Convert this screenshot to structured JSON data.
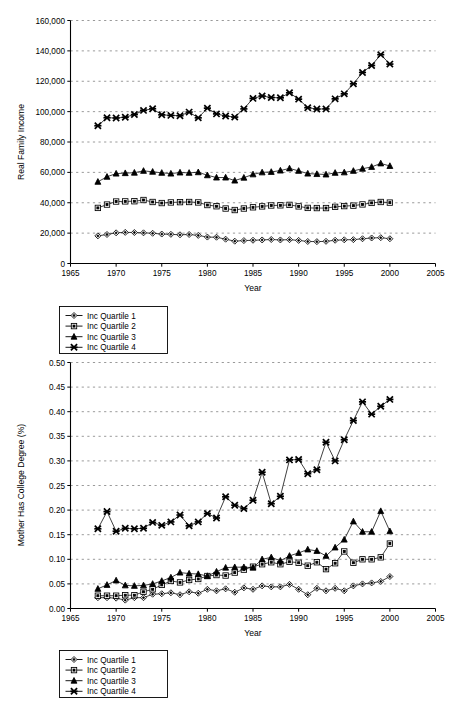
{
  "chart_data": [
    {
      "type": "line",
      "title": "",
      "xlabel": "Year",
      "ylabel": "Real Family Income",
      "xlim": [
        1965,
        2005
      ],
      "ylim": [
        0,
        160000
      ],
      "xticks": [
        1965,
        1970,
        1975,
        1980,
        1985,
        1990,
        1995,
        2000,
        2005
      ],
      "yticks": [
        0,
        20000,
        40000,
        60000,
        80000,
        100000,
        120000,
        140000,
        160000
      ],
      "ytick_labels": [
        "0",
        "20,000",
        "40,000",
        "60,000",
        "80,000",
        "100,000",
        "120,000",
        "140,000",
        "160,000"
      ],
      "grid": true,
      "legend_position": "below",
      "x": [
        1968,
        1969,
        1970,
        1971,
        1972,
        1973,
        1974,
        1975,
        1976,
        1977,
        1978,
        1979,
        1980,
        1981,
        1982,
        1983,
        1984,
        1985,
        1986,
        1987,
        1988,
        1989,
        1990,
        1991,
        1992,
        1993,
        1994,
        1995,
        1996,
        1997,
        1998,
        1999,
        2000
      ],
      "series": [
        {
          "name": "Inc Quartile 1",
          "marker": "diamond",
          "values": [
            18200,
            19100,
            20200,
            20500,
            20400,
            20200,
            19900,
            19400,
            19200,
            18900,
            19100,
            18500,
            17400,
            17300,
            16000,
            14700,
            15100,
            15300,
            15500,
            15800,
            15500,
            15700,
            15200,
            14500,
            14400,
            14600,
            15300,
            15600,
            15700,
            16300,
            16800,
            17000,
            16300
          ]
        },
        {
          "name": "Inc Quartile 2",
          "marker": "square",
          "values": [
            36600,
            38800,
            40800,
            40900,
            41000,
            41800,
            40500,
            39800,
            40200,
            40400,
            40500,
            40200,
            38500,
            37700,
            36200,
            35200,
            36200,
            37000,
            37600,
            38200,
            38300,
            38600,
            37600,
            36600,
            36500,
            36500,
            37300,
            37800,
            38100,
            38900,
            39900,
            40500,
            40100
          ]
        },
        {
          "name": "Inc Quartile 3",
          "marker": "triangle",
          "values": [
            53800,
            57100,
            59200,
            59500,
            59800,
            61000,
            60400,
            59700,
            59200,
            59900,
            59700,
            60100,
            58100,
            56600,
            56600,
            54600,
            56500,
            58700,
            60000,
            60300,
            61200,
            62600,
            61000,
            59200,
            58900,
            58600,
            59700,
            60000,
            61000,
            62400,
            63600,
            65900,
            64200
          ]
        },
        {
          "name": "Inc Quartile 4",
          "marker": "x",
          "values": [
            90700,
            96000,
            95800,
            96300,
            98100,
            100800,
            101900,
            97900,
            97500,
            97300,
            99700,
            95900,
            102300,
            98500,
            97100,
            96400,
            101800,
            108700,
            110300,
            109300,
            109100,
            112400,
            108200,
            102600,
            101700,
            101800,
            108400,
            111700,
            118300,
            125800,
            130400,
            137500,
            131300
          ]
        }
      ]
    },
    {
      "type": "line",
      "title": "",
      "xlabel": "Year",
      "ylabel": "Mother Has College Degree (%)",
      "xlim": [
        1965,
        2005
      ],
      "ylim": [
        0.0,
        0.5
      ],
      "xticks": [
        1965,
        1970,
        1975,
        1980,
        1985,
        1990,
        1995,
        2000,
        2005
      ],
      "yticks": [
        0.0,
        0.05,
        0.1,
        0.15,
        0.2,
        0.25,
        0.3,
        0.35,
        0.4,
        0.45,
        0.5
      ],
      "ytick_labels": [
        "0.00",
        "0.05",
        "0.10",
        "0.15",
        "0.20",
        "0.25",
        "0.30",
        "0.35",
        "0.40",
        "0.45",
        "0.50"
      ],
      "grid": true,
      "legend_position": "below",
      "x": [
        1968,
        1969,
        1970,
        1971,
        1972,
        1973,
        1974,
        1975,
        1976,
        1977,
        1978,
        1979,
        1980,
        1981,
        1982,
        1983,
        1984,
        1985,
        1986,
        1987,
        1988,
        1989,
        1990,
        1991,
        1992,
        1993,
        1994,
        1995,
        1996,
        1997,
        1998,
        1999,
        2000
      ],
      "series": [
        {
          "name": "Inc Quartile 1",
          "marker": "diamond",
          "values": [
            0.022,
            0.022,
            0.021,
            0.017,
            0.022,
            0.022,
            0.029,
            0.03,
            0.032,
            0.028,
            0.034,
            0.031,
            0.039,
            0.036,
            0.04,
            0.033,
            0.042,
            0.039,
            0.046,
            0.044,
            0.044,
            0.049,
            0.039,
            0.028,
            0.041,
            0.036,
            0.041,
            0.036,
            0.046,
            0.05,
            0.052,
            0.055,
            0.065
          ]
        },
        {
          "name": "Inc Quartile 2",
          "marker": "square",
          "values": [
            0.026,
            0.026,
            0.026,
            0.027,
            0.027,
            0.034,
            0.039,
            0.048,
            0.056,
            0.053,
            0.058,
            0.06,
            0.066,
            0.068,
            0.067,
            0.073,
            0.079,
            0.085,
            0.09,
            0.094,
            0.09,
            0.095,
            0.093,
            0.087,
            0.094,
            0.08,
            0.092,
            0.116,
            0.093,
            0.1,
            0.1,
            0.104,
            0.132
          ]
        },
        {
          "name": "Inc Quartile 3",
          "marker": "triangle",
          "values": [
            0.04,
            0.048,
            0.057,
            0.047,
            0.046,
            0.047,
            0.05,
            0.056,
            0.063,
            0.073,
            0.071,
            0.07,
            0.066,
            0.075,
            0.083,
            0.084,
            0.084,
            0.083,
            0.1,
            0.104,
            0.097,
            0.107,
            0.113,
            0.12,
            0.117,
            0.107,
            0.124,
            0.14,
            0.177,
            0.156,
            0.156,
            0.198,
            0.157
          ]
        },
        {
          "name": "Inc Quartile 4",
          "marker": "x",
          "values": [
            0.162,
            0.197,
            0.157,
            0.163,
            0.162,
            0.163,
            0.175,
            0.169,
            0.176,
            0.19,
            0.168,
            0.176,
            0.193,
            0.184,
            0.227,
            0.21,
            0.203,
            0.22,
            0.277,
            0.213,
            0.228,
            0.302,
            0.303,
            0.274,
            0.282,
            0.338,
            0.3,
            0.343,
            0.382,
            0.42,
            0.395,
            0.411,
            0.425
          ]
        }
      ]
    }
  ],
  "top_chart": {
    "ylabel": "Real Family Income",
    "xlabel": "Year",
    "ytick_labels": [
      "0",
      "20,000",
      "40,000",
      "60,000",
      "80,000",
      "100,000",
      "120,000",
      "140,000",
      "160,000"
    ],
    "xtick_labels": [
      "1965",
      "1970",
      "1975",
      "1980",
      "1985",
      "1990",
      "1995",
      "2000",
      "2005"
    ],
    "legend": [
      {
        "label": "Inc Quartile 1",
        "marker": "diamond"
      },
      {
        "label": "Inc Quartile 2",
        "marker": "square"
      },
      {
        "label": "Inc Quartile 3",
        "marker": "triangle"
      },
      {
        "label": "Inc Quartile 4",
        "marker": "x"
      }
    ]
  },
  "bottom_chart": {
    "ylabel": "Mother Has College Degree (%)",
    "xlabel": "Year",
    "ytick_labels": [
      "0.00",
      "0.05",
      "0.10",
      "0.15",
      "0.20",
      "0.25",
      "0.30",
      "0.35",
      "0.40",
      "0.45",
      "0.50"
    ],
    "xtick_labels": [
      "1965",
      "1970",
      "1975",
      "1980",
      "1985",
      "1990",
      "1995",
      "2000",
      "2005"
    ],
    "legend": [
      {
        "label": "Inc Quartile 1",
        "marker": "diamond"
      },
      {
        "label": "Inc Quartile 2",
        "marker": "square"
      },
      {
        "label": "Inc Quartile 3",
        "marker": "triangle"
      },
      {
        "label": "Inc Quartile 4",
        "marker": "x"
      }
    ]
  },
  "colors": {
    "ink": "#000000",
    "grid": "#808080",
    "background": "#ffffff"
  }
}
